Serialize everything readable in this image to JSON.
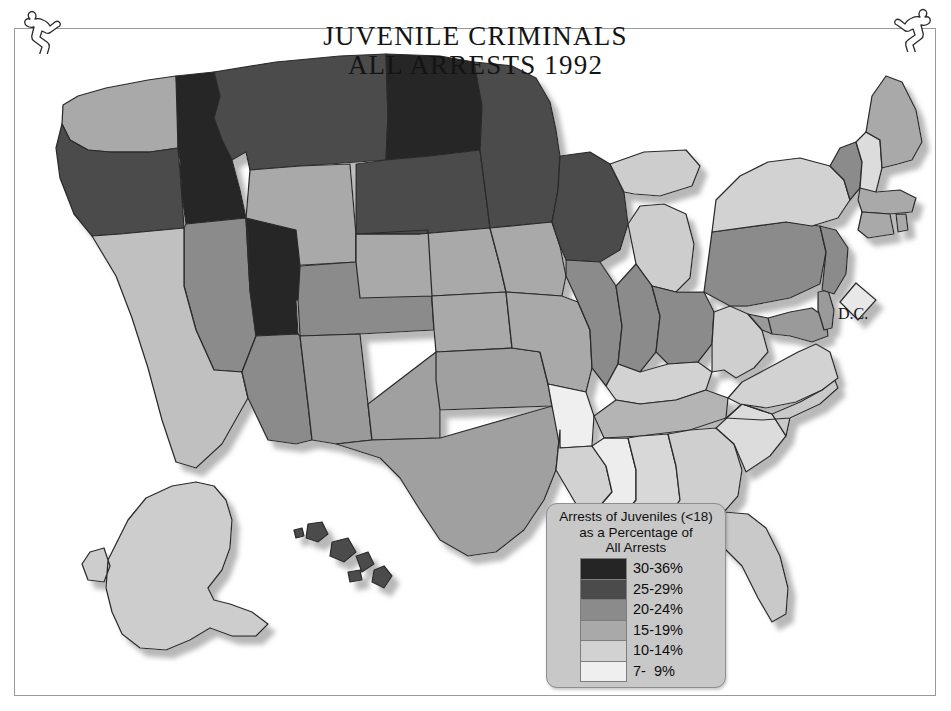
{
  "document": {
    "title_line1": "JUVENILE CRIMINALS",
    "title_line2": "ALL ARRESTS 1992"
  },
  "ornaments": [
    {
      "name": "running-figure-left",
      "position": "top-left"
    },
    {
      "name": "running-figure-right",
      "position": "top-right"
    }
  ],
  "legend": {
    "caption_line1": "Arrests of Juveniles (<18)",
    "caption_line2": "as a Percentage of",
    "caption_line3": "All Arrests",
    "entries": [
      {
        "label": "30-36%",
        "color": "#252525"
      },
      {
        "label": "25-29%",
        "color": "#4b4b4b"
      },
      {
        "label": "20-24%",
        "color": "#8b8b8b"
      },
      {
        "label": "15-19%",
        "color": "#a9a9a9"
      },
      {
        "label": "10-14%",
        "color": "#d2d2d2"
      },
      {
        "label": "7-  9%",
        "color": "#efefef"
      }
    ]
  },
  "map": {
    "dc_label": "D.C.",
    "outline_color": "#2a2a2a",
    "shadow_color": "#b4b4b4",
    "background": "#ffffff",
    "frame_color": "#9a9a9a",
    "states": [
      {
        "code": "WA",
        "name": "Washington",
        "bin": "20-24%",
        "color": "#a9a9a9"
      },
      {
        "code": "OR",
        "name": "Oregon",
        "bin": "25-29%",
        "color": "#4b4b4b"
      },
      {
        "code": "ID",
        "name": "Idaho",
        "bin": "30-36%",
        "color": "#252525"
      },
      {
        "code": "MT",
        "name": "Montana",
        "bin": "25-29%",
        "color": "#4b4b4b"
      },
      {
        "code": "ND",
        "name": "North Dakota",
        "bin": "30-36%",
        "color": "#252525"
      },
      {
        "code": "MN",
        "name": "Minnesota",
        "bin": "25-29%",
        "color": "#4b4b4b"
      },
      {
        "code": "WI",
        "name": "Wisconsin",
        "bin": "25-29%",
        "color": "#4b4b4b"
      },
      {
        "code": "SD",
        "name": "South Dakota",
        "bin": "25-29%",
        "color": "#4b4b4b"
      },
      {
        "code": "WY",
        "name": "Wyoming",
        "bin": "15-19%",
        "color": "#a9a9a9"
      },
      {
        "code": "UT",
        "name": "Utah",
        "bin": "30-36%",
        "color": "#252525"
      },
      {
        "code": "NV",
        "name": "Nevada",
        "bin": "20-24%",
        "color": "#8b8b8b"
      },
      {
        "code": "CA",
        "name": "California",
        "bin": "15-19%",
        "color": "#c0c0c0"
      },
      {
        "code": "AZ",
        "name": "Arizona",
        "bin": "20-24%",
        "color": "#8b8b8b"
      },
      {
        "code": "NM",
        "name": "New Mexico",
        "bin": "20-24%",
        "color": "#9a9a9a"
      },
      {
        "code": "CO",
        "name": "Colorado",
        "bin": "20-24%",
        "color": "#8b8b8b"
      },
      {
        "code": "NE",
        "name": "Nebraska",
        "bin": "15-19%",
        "color": "#a9a9a9"
      },
      {
        "code": "IA",
        "name": "Iowa",
        "bin": "15-19%",
        "color": "#a9a9a9"
      },
      {
        "code": "KS",
        "name": "Kansas",
        "bin": "15-19%",
        "color": "#a9a9a9"
      },
      {
        "code": "MO",
        "name": "Missouri",
        "bin": "15-19%",
        "color": "#a9a9a9"
      },
      {
        "code": "OK",
        "name": "Oklahoma",
        "bin": "15-19%",
        "color": "#a0a0a0"
      },
      {
        "code": "TX",
        "name": "Texas",
        "bin": "15-19%",
        "color": "#a0a0a0"
      },
      {
        "code": "AR",
        "name": "Arkansas",
        "bin": "7-  9%",
        "color": "#efefef"
      },
      {
        "code": "LA",
        "name": "Louisiana",
        "bin": "10-14%",
        "color": "#d2d2d2"
      },
      {
        "code": "MS",
        "name": "Mississippi",
        "bin": "7-  9%",
        "color": "#ededed"
      },
      {
        "code": "AL",
        "name": "Alabama",
        "bin": "10-14%",
        "color": "#d8d8d8"
      },
      {
        "code": "TN",
        "name": "Tennessee",
        "bin": "15-19%",
        "color": "#b4b4b4"
      },
      {
        "code": "KY",
        "name": "Kentucky",
        "bin": "10-14%",
        "color": "#d2d2d2"
      },
      {
        "code": "IL",
        "name": "Illinois",
        "bin": "20-24%",
        "color": "#8b8b8b"
      },
      {
        "code": "IN",
        "name": "Indiana",
        "bin": "20-24%",
        "color": "#8b8b8b"
      },
      {
        "code": "OH",
        "name": "Ohio",
        "bin": "20-24%",
        "color": "#8b8b8b"
      },
      {
        "code": "MI",
        "name": "Michigan",
        "bin": "10-14%",
        "color": "#cdcdcd"
      },
      {
        "code": "WV",
        "name": "West Virginia",
        "bin": "10-14%",
        "color": "#cfcfcf"
      },
      {
        "code": "VA",
        "name": "Virginia",
        "bin": "10-14%",
        "color": "#d2d2d2"
      },
      {
        "code": "NC",
        "name": "North Carolina",
        "bin": "10-14%",
        "color": "#c9c9c9"
      },
      {
        "code": "SC",
        "name": "South Carolina",
        "bin": "10-14%",
        "color": "#dcdcdc"
      },
      {
        "code": "GA",
        "name": "Georgia",
        "bin": "10-14%",
        "color": "#cfcfcf"
      },
      {
        "code": "FL",
        "name": "Florida",
        "bin": "10-14%",
        "color": "#c9c9c9"
      },
      {
        "code": "PA",
        "name": "Pennsylvania",
        "bin": "20-24%",
        "color": "#8b8b8b"
      },
      {
        "code": "NY",
        "name": "New York",
        "bin": "10-14%",
        "color": "#d2d2d2"
      },
      {
        "code": "NJ",
        "name": "New Jersey",
        "bin": "20-24%",
        "color": "#8b8b8b"
      },
      {
        "code": "DE",
        "name": "Delaware",
        "bin": "20-24%",
        "color": "#9a9a9a"
      },
      {
        "code": "MD",
        "name": "Maryland",
        "bin": "20-24%",
        "color": "#9a9a9a"
      },
      {
        "code": "CT",
        "name": "Connecticut",
        "bin": "15-19%",
        "color": "#a9a9a9"
      },
      {
        "code": "RI",
        "name": "Rhode Island",
        "bin": "15-19%",
        "color": "#a9a9a9"
      },
      {
        "code": "MA",
        "name": "Massachusetts",
        "bin": "15-19%",
        "color": "#a9a9a9"
      },
      {
        "code": "VT",
        "name": "Vermont",
        "bin": "20-24%",
        "color": "#8b8b8b"
      },
      {
        "code": "NH",
        "name": "New Hampshire",
        "bin": "10-14%",
        "color": "#dcdcdc"
      },
      {
        "code": "ME",
        "name": "Maine",
        "bin": "15-19%",
        "color": "#a9a9a9"
      },
      {
        "code": "AK",
        "name": "Alaska",
        "bin": "10-14%",
        "color": "#cdcdcd"
      },
      {
        "code": "HI",
        "name": "Hawaii",
        "bin": "25-29%",
        "color": "#4b4b4b"
      },
      {
        "code": "DC",
        "name": "District of Columbia",
        "bin": "10-14%",
        "color": "#e8e8e8"
      }
    ]
  }
}
